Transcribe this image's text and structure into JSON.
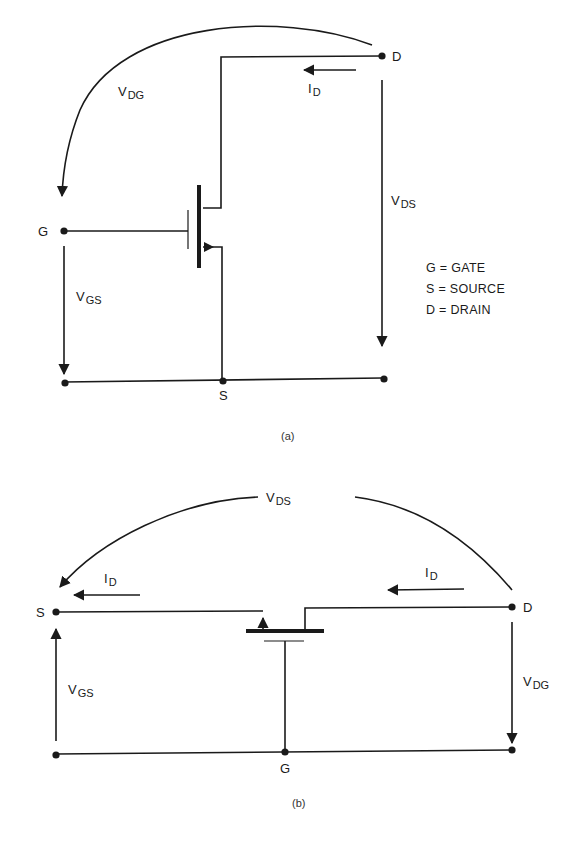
{
  "figure_a": {
    "caption": "(a)",
    "terminals": {
      "gate": "G",
      "source": "S",
      "drain": "D"
    },
    "labels": {
      "vdg": {
        "main": "V",
        "sub": "DG"
      },
      "id": {
        "main": "I",
        "sub": "D"
      },
      "vds": {
        "main": "V",
        "sub": "DS"
      },
      "vgs": {
        "main": "V",
        "sub": "GS"
      }
    },
    "legend": [
      {
        "text": "G = GATE"
      },
      {
        "text": "S = SOURCE"
      },
      {
        "text": "D = DRAIN"
      }
    ]
  },
  "figure_b": {
    "caption": "(b)",
    "terminals": {
      "gate": "G",
      "source": "S",
      "drain": "D"
    },
    "labels": {
      "vds": {
        "main": "V",
        "sub": "DS"
      },
      "id_left": {
        "main": "I",
        "sub": "D"
      },
      "id_right": {
        "main": "I",
        "sub": "D"
      },
      "vgs": {
        "main": "V",
        "sub": "GS"
      },
      "vdg": {
        "main": "V",
        "sub": "DG"
      }
    }
  },
  "colors": {
    "ink": "#1a1a1a",
    "background": "#ffffff"
  }
}
